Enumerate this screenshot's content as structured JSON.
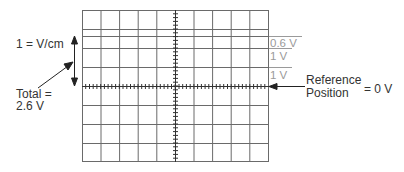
{
  "diagram": {
    "grid": {
      "columns": 10,
      "rows": 8,
      "minor_ticks_per_division": 5,
      "line_color": "#555555",
      "tick_color": "#333333"
    },
    "left_annotations": {
      "scale_label": "1 = V/cm",
      "total_label_line1": "Total =",
      "total_label_line2": "2.6 V"
    },
    "right_annotations": {
      "segment_labels": [
        "0.6 V",
        "1 V",
        "1 V"
      ],
      "reference_line1": "Reference",
      "reference_line2": "Position",
      "reference_value": "= 0 V"
    },
    "colors": {
      "segment_label": "#9a9a9a",
      "text": "#333333",
      "arrow": "#222222"
    }
  }
}
